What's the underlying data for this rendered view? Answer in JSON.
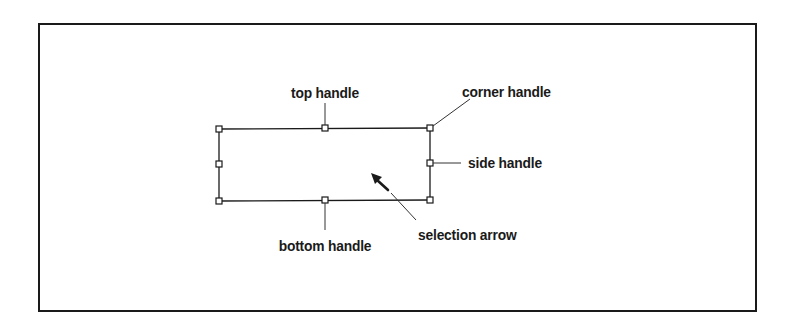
{
  "diagram": {
    "labels": {
      "top_handle": "top handle",
      "corner_handle": "corner handle",
      "side_handle": "side handle",
      "bottom_handle": "bottom handle",
      "selection_arrow": "selection arrow"
    },
    "colors": {
      "stroke": "#1a1a1a",
      "background": "#ffffff"
    }
  }
}
